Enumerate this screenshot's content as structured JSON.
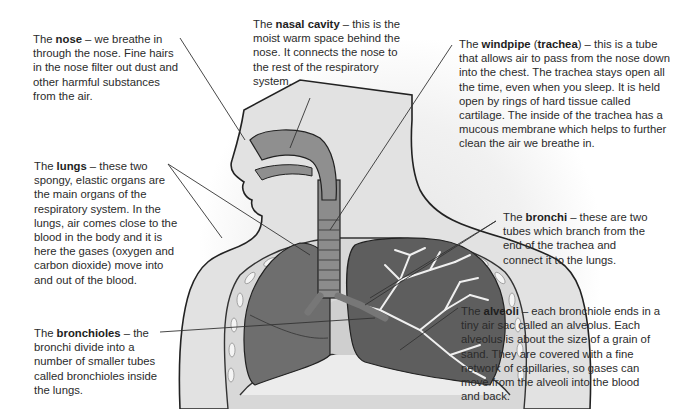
{
  "diagram": {
    "title": "Respiratory system",
    "labels": [
      {
        "id": "nose",
        "prefix": "The ",
        "term": "nose",
        "extra": "",
        "text": " – we breathe in through the nose. Fine hairs in the nose filter out dust and other harmful substances from the air."
      },
      {
        "id": "nasal-cavity",
        "prefix": "The ",
        "term": "nasal cavity",
        "extra": "",
        "text": " – this is the moist warm space behind the nose. It connects the nose to the rest of the respiratory system."
      },
      {
        "id": "windpipe",
        "prefix": "The ",
        "term": "windpipe",
        "extra": "trachea",
        "text": " – this is a tube that allows air to pass from the nose down into the chest. The trachea stays open all the time, even when you sleep. It is held open by rings of hard tissue called cartilage. The inside of the trachea has a mucous membrane which helps to further clean the air we breathe in."
      },
      {
        "id": "lungs",
        "prefix": "The ",
        "term": "lungs",
        "extra": "",
        "text": " – these two spongy, elastic organs are the main organs of the respiratory system. In the lungs, air comes close to the blood in the body and it is here the gases (oxygen and carbon dioxide) move into and out of the blood."
      },
      {
        "id": "bronchi",
        "prefix": "The ",
        "term": "bronchi",
        "extra": "",
        "text": " – these are two tubes which branch from the end of the trachea and connect it to the lungs."
      },
      {
        "id": "bronchioles",
        "prefix": "The ",
        "term": "bronchioles",
        "extra": "",
        "text": " – the bronchi divide into a number of smaller tubes called bronchioles inside the lungs."
      },
      {
        "id": "alveoli",
        "prefix": "The ",
        "term": "alveoli",
        "extra": "",
        "text": " – each bronchiole ends in a tiny air sac called an alveolus. Each alveolus is about the size of a grain of sand. They are covered with a fine network of capillaries, so gases can move from the alveoli into the blood and back."
      }
    ],
    "colors": {
      "skin": "#d9d9d9",
      "organ": "#7a7a7a",
      "lung": "#6a6a6a",
      "line": "#333333",
      "text": "#2b2b2b"
    }
  }
}
